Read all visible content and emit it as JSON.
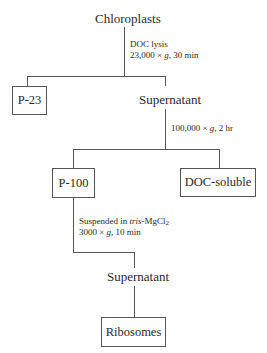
{
  "diagram": {
    "type": "flowchart",
    "root": {
      "label": "Chloroplasts"
    },
    "steps": [
      {
        "condition_line1": "DOC lysis",
        "condition_line2_prefix": "23,000 × ",
        "condition_line2_g": "g",
        "condition_line2_suffix": ", 30 min",
        "left_product": "P-23",
        "right_product": "Supernatant"
      },
      {
        "condition_prefix": "100,000 × ",
        "condition_g": "g",
        "condition_suffix": ", 2 hr",
        "left_product": "P-100",
        "right_product": "DOC-soluble"
      },
      {
        "condition_line1_prefix": "Suspended in ",
        "condition_line1_italic": "tris",
        "condition_line1_suffix": "-MgCl",
        "condition_line1_sub": "2",
        "condition_line2_prefix": "3000 × ",
        "condition_line2_g": "g",
        "condition_line2_suffix": ", 10 min",
        "product": "Supernatant"
      }
    ],
    "final": {
      "label": "Ribosomes"
    },
    "colors": {
      "line": "#555555",
      "text": "#2a2a2a",
      "background": "#ffffff"
    }
  }
}
